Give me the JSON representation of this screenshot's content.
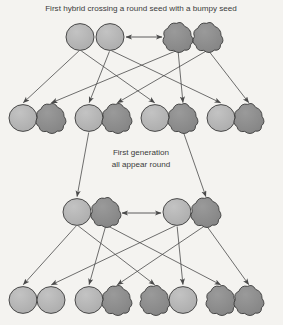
{
  "diagram": {
    "background_color": "#f4f3f0",
    "labels": {
      "top_caption": "First hybrid crossing a round seed with a bumpy seed",
      "middle_caption_line1": "First generation",
      "middle_caption_line2": "all appear round"
    },
    "colors": {
      "round_seed_fill": "#b4b4b4",
      "bumpy_seed_fill": "#8c8c8c",
      "outline": "#3c3c3c",
      "arrow": "#4a4a4a",
      "text": "#3b3b3b"
    },
    "legend": {
      "round_label": "round seed",
      "bumpy_label": "bumpy seed"
    },
    "rows": [
      {
        "row_name": "parent-generation",
        "y": 37,
        "shapes": [
          {
            "type": "round",
            "cx": 80,
            "label": "round seed"
          },
          {
            "type": "round",
            "cx": 110,
            "label": "round seed"
          },
          {
            "type": "bumpy",
            "cx": 178,
            "label": "bumpy seed"
          },
          {
            "type": "bumpy",
            "cx": 208,
            "label": "bumpy seed"
          }
        ],
        "cross_arrow": {
          "from_x": 126,
          "to_x": 162,
          "y": 37,
          "double_headed": true
        }
      },
      {
        "row_name": "first-generation",
        "y": 118,
        "shapes": [
          {
            "type": "round",
            "cx": 23,
            "label": "round seed"
          },
          {
            "type": "bumpy",
            "cx": 51,
            "label": "bumpy seed"
          },
          {
            "type": "round",
            "cx": 89,
            "label": "round seed"
          },
          {
            "type": "bumpy",
            "cx": 117,
            "label": "bumpy seed"
          },
          {
            "type": "round",
            "cx": 155,
            "label": "round seed"
          },
          {
            "type": "bumpy",
            "cx": 183,
            "label": "bumpy seed"
          },
          {
            "type": "round",
            "cx": 221,
            "label": "round seed"
          },
          {
            "type": "bumpy",
            "cx": 249,
            "label": "bumpy seed"
          }
        ]
      },
      {
        "row_name": "second-cross-parents",
        "y": 212,
        "shapes": [
          {
            "type": "round",
            "cx": 77,
            "label": "round seed"
          },
          {
            "type": "bumpy",
            "cx": 106,
            "label": "bumpy seed"
          },
          {
            "type": "round",
            "cx": 177,
            "label": "round seed"
          },
          {
            "type": "bumpy",
            "cx": 206,
            "label": "bumpy seed"
          }
        ],
        "cross_arrow": {
          "from_x": 122,
          "to_x": 161,
          "y": 213,
          "double_headed": true
        }
      },
      {
        "row_name": "second-generation",
        "y": 300,
        "shapes": [
          {
            "type": "round",
            "cx": 23,
            "label": "round seed"
          },
          {
            "type": "round",
            "cx": 51,
            "label": "round seed"
          },
          {
            "type": "round",
            "cx": 89,
            "label": "round seed"
          },
          {
            "type": "bumpy",
            "cx": 117,
            "label": "bumpy seed"
          },
          {
            "type": "bumpy",
            "cx": 155,
            "label": "bumpy seed"
          },
          {
            "type": "round",
            "cx": 183,
            "label": "round seed"
          },
          {
            "type": "bumpy",
            "cx": 221,
            "label": "bumpy seed"
          },
          {
            "type": "bumpy",
            "cx": 249,
            "label": "bumpy seed"
          }
        ]
      }
    ],
    "edges_top": [
      {
        "from": 0,
        "to": 0
      },
      {
        "from": 0,
        "to": 4
      },
      {
        "from": 1,
        "to": 2
      },
      {
        "from": 1,
        "to": 6
      },
      {
        "from": 2,
        "to": 1
      },
      {
        "from": 2,
        "to": 5
      },
      {
        "from": 3,
        "to": 3
      },
      {
        "from": 3,
        "to": 7
      }
    ],
    "edges_middle": [
      {
        "from": 2,
        "to": 0
      },
      {
        "from": 5,
        "to": 3
      }
    ],
    "edges_bottom": [
      {
        "from": 0,
        "to": 0
      },
      {
        "from": 0,
        "to": 4
      },
      {
        "from": 1,
        "to": 2
      },
      {
        "from": 1,
        "to": 6
      },
      {
        "from": 2,
        "to": 1
      },
      {
        "from": 2,
        "to": 5
      },
      {
        "from": 3,
        "to": 3
      },
      {
        "from": 3,
        "to": 7
      }
    ],
    "captions_position": {
      "top_x": 141,
      "top_y": 11,
      "mid_x": 141,
      "mid_y1": 155,
      "mid_y2": 167
    }
  }
}
